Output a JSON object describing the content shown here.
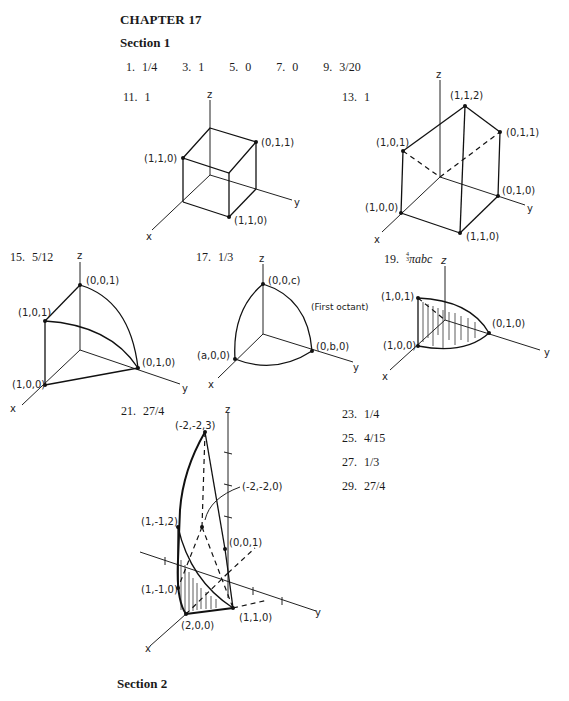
{
  "chapter": {
    "title": "CHAPTER 17"
  },
  "section1": {
    "heading": "Section 1",
    "answers_row1": [
      {
        "num": "1.",
        "val": "1/4"
      },
      {
        "num": "3.",
        "val": "1"
      },
      {
        "num": "5.",
        "val": "0"
      },
      {
        "num": "7.",
        "val": "0"
      },
      {
        "num": "9.",
        "val": "3/20"
      }
    ],
    "figure_answers": {
      "a11": {
        "num": "11.",
        "val": "1"
      },
      "a13": {
        "num": "13.",
        "val": "1"
      },
      "a15": {
        "num": "15.",
        "val": "5/12"
      },
      "a17": {
        "num": "17.",
        "val": "1/3"
      },
      "a19": {
        "num": "19.",
        "frac_num": "4",
        "frac_den": "3",
        "val": "πabc"
      },
      "a21": {
        "num": "21.",
        "val": "27/4"
      }
    },
    "answers_col": [
      {
        "num": "23.",
        "val": "1/4"
      },
      {
        "num": "25.",
        "val": "4/15"
      },
      {
        "num": "27.",
        "val": "1/3"
      },
      {
        "num": "29.",
        "val": "27/4"
      }
    ]
  },
  "figures": {
    "fig11": {
      "z": "z",
      "x": "x",
      "y": "y",
      "p1": "(1,1,0)",
      "p2": "(0,1,1)",
      "p3": "(1,1,0)"
    },
    "fig13": {
      "z": "z",
      "x": "x",
      "y": "y",
      "p112": "(1,1,2)",
      "p011": "(0,1,1)",
      "p101": "(1,0,1)",
      "p010": "(0,1,0)",
      "p100": "(1,0,0)",
      "p110": "(1,1,0)"
    },
    "fig15": {
      "z": "z",
      "x": "x",
      "y": "y",
      "p001": "(0,0,1)",
      "p101": "(1,0,1)",
      "p010": "(0,1,0)",
      "p100": "(1,0,0)"
    },
    "fig17": {
      "z": "z",
      "x": "x",
      "y": "y",
      "p00c": "(0,0,c)",
      "p0b0": "(0,b,0)",
      "pa00": "(a,0,0)",
      "note": "(First octant)"
    },
    "fig19": {
      "z": "z",
      "x": "x",
      "y": "y",
      "p101": "(1,0,1)",
      "p100": "(1,0,0)",
      "p010": "(0,1,0)"
    },
    "fig21": {
      "z": "z",
      "x": "x",
      "y": "y",
      "pm2m23": "(-2,-2,3)",
      "pm2m20": "(-2,-2,0)",
      "p1m12": "(1,-1,2)",
      "p001": "(0,0,1)",
      "p1m10": "(1,-1,0)",
      "p200": "(2,0,0)",
      "p110": "(1,1,0)"
    }
  },
  "section2": {
    "heading": "Section 2"
  }
}
